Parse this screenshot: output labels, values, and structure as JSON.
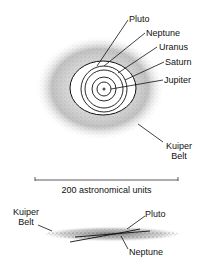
{
  "diagram": {
    "top_view": {
      "labels": {
        "pluto": "Pluto",
        "neptune": "Neptune",
        "uranus": "Uranus",
        "saturn": "Saturn",
        "jupiter": "Jupiter",
        "kuiper_line1": "Kuiper",
        "kuiper_line2": "Belt"
      }
    },
    "scale_bar": {
      "label": "200 astronomical units"
    },
    "side_view": {
      "labels": {
        "kuiper_line1": "Kuiper",
        "kuiper_line2": "Belt",
        "pluto": "Pluto",
        "neptune": "Neptune"
      }
    },
    "colors": {
      "ink": "#111111",
      "background": "#ffffff"
    }
  }
}
